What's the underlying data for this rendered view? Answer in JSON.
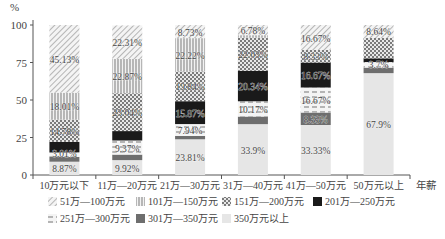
{
  "chart_data": {
    "type": "bar",
    "stacked": true,
    "title": "",
    "xlabel": "年薪",
    "ylabel": "%",
    "ylim": [
      0,
      100
    ],
    "yticks": [
      0,
      25,
      50,
      75,
      100
    ],
    "grid": false,
    "legend_position": "bottom",
    "categories": [
      "10万元以下",
      "11万—20万元",
      "21万—30万元",
      "31万—40万元",
      "41万—50万元",
      "50万元以上"
    ],
    "series": [
      {
        "name": "350万元以上",
        "pattern": "light",
        "color": "#e6e6e6",
        "values": [
          8.87,
          9.92,
          23.81,
          33.9,
          33.33,
          67.9
        ]
      },
      {
        "name": "301万—350万元",
        "pattern": "darkgray",
        "color": "#6e6e6e",
        "values": [
          3.2,
          3.7,
          2.2,
          5.08,
          8.33,
          3.7
        ]
      },
      {
        "name": "251万—300万元",
        "pattern": "dashed",
        "color": "#999999",
        "values": [
          3.01,
          9.37,
          7.94,
          10.17,
          16.67,
          3.7
        ]
      },
      {
        "name": "201万—250万元",
        "pattern": "black",
        "color": "#1a1a1a",
        "values": [
          7.0,
          6.29,
          15.24,
          20.34,
          16.67,
          2.47
        ]
      },
      {
        "name": "151万—200万元",
        "pattern": "checker",
        "color": "#888888",
        "values": [
          14.78,
          25.24,
          19.84,
          22.03,
          8.33,
          13.59
        ]
      },
      {
        "name": "101万—150万元",
        "pattern": "vertical",
        "color": "#aaaaaa",
        "values": [
          18.01,
          22.87,
          22.22,
          1.7,
          0,
          0
        ]
      },
      {
        "name": "51万—100万元",
        "pattern": "diagonal",
        "color": "#aaaaaa",
        "values": [
          45.13,
          22.31,
          8.73,
          6.78,
          16.67,
          8.64
        ]
      }
    ],
    "data_labels": [
      [
        "8.87%",
        "",
        "3.01%",
        "",
        "14.78%",
        "18.01%",
        "45.13%"
      ],
      [
        "9.92%",
        "",
        "9.37%",
        "",
        "23.04%",
        "22.87%",
        "22.31%"
      ],
      [
        "23.81%",
        "",
        "7.94%",
        "15.87%",
        "19.84%",
        "22.22%",
        "8.73%"
      ],
      [
        "33.9%",
        "",
        "10.17%",
        "20.34%",
        "22.03%",
        "",
        "6.78%"
      ],
      [
        "33.33%",
        "8.33%",
        "16.67%",
        "16.67%",
        "8.33%",
        "",
        "16.67%"
      ],
      [
        "67.9%",
        "",
        "3.7%",
        "",
        "",
        "",
        "8.64%"
      ]
    ]
  },
  "legend": [
    {
      "label": "51万—100万元",
      "pattern": "diagonal"
    },
    {
      "label": "101万—150万元",
      "pattern": "vertical"
    },
    {
      "label": "151万—200万元",
      "pattern": "checker"
    },
    {
      "label": "201万—250万元",
      "pattern": "black"
    },
    {
      "label": "251万—300万元",
      "pattern": "dashed"
    },
    {
      "label": "301万—350万元",
      "pattern": "darkgray"
    },
    {
      "label": "350万元以上",
      "pattern": "light"
    }
  ]
}
